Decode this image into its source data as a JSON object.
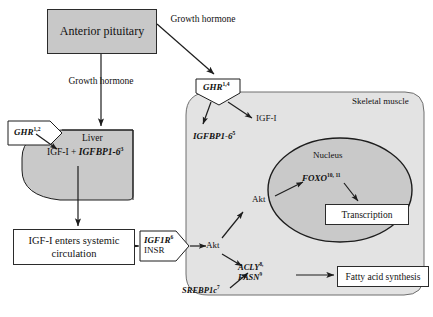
{
  "figure": {
    "type": "biological-pathway-diagram"
  },
  "nodes": {
    "anterior_pituitary": "Anterior pituitary",
    "growth_hormone_left": "Growth hormone",
    "growth_hormone_right": "Growth hormone",
    "liver": "Liver",
    "liver_product_plain": "IGF-I + ",
    "liver_product_italic": "IGFBP1-6",
    "liver_product_sup": "3",
    "ghr_liver": "GHR",
    "ghr_liver_sup": "1,2",
    "systemic_circulation": "IGF-I enters systemic circulation",
    "igf1_transport": "IGF-I",
    "ghr_muscle": "GHR",
    "ghr_muscle_sup": "1,4",
    "igf1_muscle": "IGF-I",
    "igfbp_muscle": "IGFBP1-6",
    "igfbp_muscle_sup": "5",
    "skeletal_muscle": "Skeletal muscle",
    "nucleus": "Nucleus",
    "foxo": "FOXO",
    "foxo_sup": "10, 11",
    "transcription": "Transcription",
    "akt_upper": "Akt",
    "akt_lower": "Akt",
    "igf1r": "IGF1R",
    "igf1r_sup": "6",
    "insr": "INSR",
    "acly": "ACLY",
    "acly_sup": "8,",
    "fasn": "FASN",
    "fasn_sup": "9",
    "srebp1c": "SREBP1c",
    "srebp1c_sup": "7",
    "fatty_acid_synthesis": "Fatty acid synthesis"
  },
  "colors": {
    "pituitary_fill": "#c8c8c8",
    "liver_fill": "#c9c9c9",
    "muscle_fill": "#e3e3e3",
    "nucleus_fill": "#c9c9c9",
    "stroke": "#2b2b2b",
    "background": "#ffffff"
  }
}
